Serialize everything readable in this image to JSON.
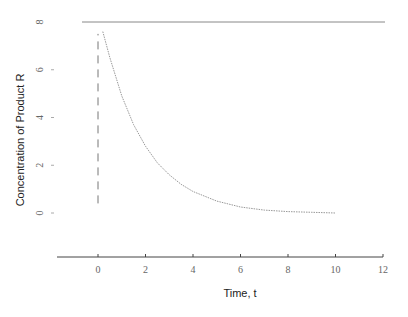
{
  "chart_data": {
    "type": "line",
    "title": "",
    "xlabel": "Time, t",
    "ylabel": "Concentration of Product R",
    "xlim": [
      -1,
      12
    ],
    "ylim": [
      -1.8,
      8.2
    ],
    "x_ticks": [
      0,
      2,
      4,
      6,
      8,
      10,
      12
    ],
    "x_tick_labels": [
      "0",
      "2",
      "4",
      "6",
      "8",
      "10",
      "12"
    ],
    "y_ticks": [
      0,
      2,
      4,
      6,
      8
    ],
    "y_tick_labels": [
      "0",
      "2",
      "4",
      "6",
      "8"
    ],
    "grid": false,
    "legend": null,
    "series": [
      {
        "name": "Concentration curve",
        "style": "dotted",
        "color": "#999999",
        "x": [
          0.2,
          0.5,
          1.0,
          1.5,
          2.0,
          2.5,
          3.0,
          3.5,
          4.0,
          5.0,
          6.0,
          7.0,
          8.0,
          9.0,
          10.0
        ],
        "y": [
          7.6,
          6.5,
          4.9,
          3.7,
          2.8,
          2.1,
          1.6,
          1.2,
          0.9,
          0.5,
          0.25,
          0.12,
          0.06,
          0.03,
          0.0
        ]
      },
      {
        "name": "Initial jump",
        "style": "dashed",
        "color": "#777777",
        "x": [
          0,
          0
        ],
        "y": [
          0.4,
          7.5
        ]
      },
      {
        "name": "Upper level",
        "style": "solid",
        "color": "#888888",
        "x": [
          -0.7,
          12
        ],
        "y": [
          8,
          8
        ]
      }
    ]
  }
}
